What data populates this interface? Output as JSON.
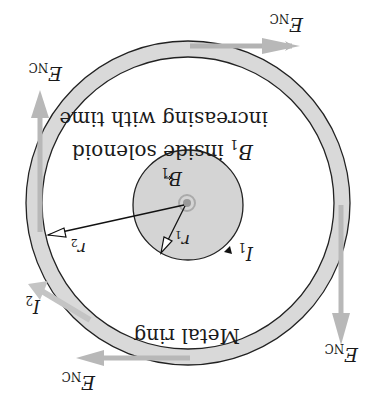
{
  "figure": {
    "orientation": "rotated-180",
    "colors": {
      "background": "#ffffff",
      "ring_fill": "#d9d9d9",
      "solenoid_fill": "#d4d4d4",
      "outline": "#222222",
      "field_arrow": "#b3b3b3",
      "center_dot": "#9a9a9a"
    },
    "labels": {
      "solenoid_caption_line1_var": "B",
      "solenoid_caption_line1_sub": "1",
      "solenoid_caption_line1_rest": " inside solenoid",
      "solenoid_caption_line2": "increasing with time",
      "ring_caption": "Metal ring",
      "b1_var": "B",
      "b1_sub": "1",
      "r1_var": "r",
      "r1_sub": "1",
      "r2_var": "r",
      "r2_sub": "2",
      "i1_var": "I",
      "i1_sub": "1",
      "i2_var": "I",
      "i2_sub": "2",
      "enc_var": "E",
      "enc_sub": "NC"
    },
    "field_arrows": [
      {
        "position": "top-right",
        "label": "E_NC"
      },
      {
        "position": "upper-left",
        "label": "E_NC"
      },
      {
        "position": "lower-right",
        "label": "E_NC"
      },
      {
        "position": "bottom-left",
        "label": "E_NC"
      }
    ]
  }
}
